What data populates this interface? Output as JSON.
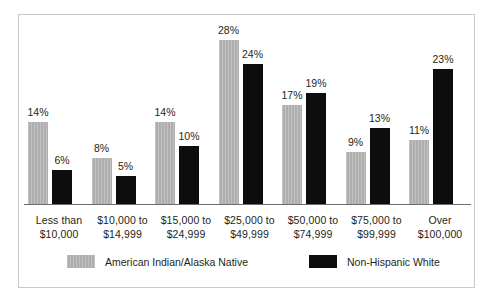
{
  "chart_data": {
    "type": "bar",
    "title": "",
    "subtitle": "",
    "xlabel": "",
    "ylabel": "",
    "ylim": [
      0,
      30
    ],
    "grid": false,
    "legend_position": "bottom",
    "value_suffix": "%",
    "categories": [
      "Less than $10,000",
      "$10,000 to $14,999",
      "$15,000 to $24,999",
      "$25,000 to $49,999",
      "$50,000 to $74,999",
      "$75,000 to $99,999",
      "Over $100,000"
    ],
    "category_lines": [
      [
        "Less than",
        "$10,000"
      ],
      [
        "$10,000 to",
        "$14,999"
      ],
      [
        "$15,000 to",
        "$24,999"
      ],
      [
        "$25,000 to",
        "$49,999"
      ],
      [
        "$50,000 to",
        "$74,999"
      ],
      [
        "$75,000 to",
        "$99,999"
      ],
      [
        "Over",
        "$100,000"
      ]
    ],
    "series": [
      {
        "name": "American Indian/Alaska Native",
        "color": "#aeaeae",
        "values": [
          14,
          8,
          14,
          28,
          17,
          9,
          11
        ],
        "labels": [
          "14%",
          "8%",
          "14%",
          "28%",
          "17%",
          "9%",
          "11%"
        ]
      },
      {
        "name": "Non-Hispanic White",
        "color": "#0d0d0d",
        "values": [
          6,
          5,
          10,
          24,
          19,
          13,
          23
        ],
        "labels": [
          "6%",
          "5%",
          "10%",
          "24%",
          "19%",
          "13%",
          "23%"
        ]
      }
    ]
  },
  "legend": {
    "items": [
      {
        "label": "American Indian/Alaska Native",
        "swatch": "native"
      },
      {
        "label": "Non-Hispanic White",
        "swatch": "white-nh"
      }
    ]
  },
  "colors": {
    "series_native": "#aeaeae",
    "series_white": "#0d0d0d",
    "axis": "#6e6e6e",
    "frame": "#c9c9c9",
    "text": "#231f20",
    "background": "#ffffff"
  }
}
